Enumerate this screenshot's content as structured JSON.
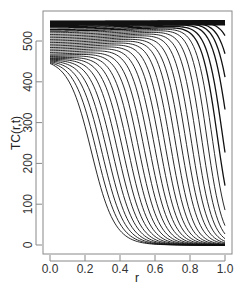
{
  "chart_data": {
    "type": "line",
    "title": "",
    "xlabel": "r",
    "ylabel": "TC(r,t)",
    "xlim": [
      -0.04,
      1.04
    ],
    "ylim": [
      -20,
      560
    ],
    "xticks": [
      0.0,
      0.2,
      0.4,
      0.6,
      0.8,
      1.0
    ],
    "xtick_labels": [
      "0.0",
      "0.2",
      "0.4",
      "0.6",
      "0.8",
      "1.0"
    ],
    "yticks": [
      0,
      100,
      200,
      300,
      400,
      500
    ],
    "ytick_labels": [
      "0",
      "100",
      "200",
      "300",
      "400",
      "500"
    ],
    "grid": false,
    "legend": null,
    "line_color": "#111111",
    "x": [
      0.0,
      0.1,
      0.2,
      0.3,
      0.4,
      0.5,
      0.6,
      0.7,
      0.8,
      0.9,
      1.0
    ],
    "curve_params": [
      {
        "a0": 548,
        "a1": 550,
        "r0": 2.0,
        "w": 0.05
      },
      {
        "a0": 546,
        "a1": 550,
        "r0": 1.6,
        "w": 0.05
      },
      {
        "a0": 544,
        "a1": 550,
        "r0": 1.35,
        "w": 0.05
      },
      {
        "a0": 542,
        "a1": 550,
        "r0": 1.2,
        "w": 0.05
      },
      {
        "a0": 540,
        "a1": 549,
        "r0": 1.12,
        "w": 0.045
      },
      {
        "a0": 538,
        "a1": 548,
        "r0": 1.08,
        "w": 0.045
      },
      {
        "a0": 535,
        "a1": 547,
        "r0": 1.05,
        "w": 0.045
      },
      {
        "a0": 532,
        "a1": 545,
        "r0": 1.02,
        "w": 0.045
      },
      {
        "a0": 528,
        "a1": 543,
        "r0": 0.985,
        "w": 0.045
      },
      {
        "a0": 524,
        "a1": 541,
        "r0": 0.955,
        "w": 0.045
      },
      {
        "a0": 520,
        "a1": 539,
        "r0": 0.925,
        "w": 0.045
      },
      {
        "a0": 516,
        "a1": 537,
        "r0": 0.895,
        "w": 0.045
      },
      {
        "a0": 512,
        "a1": 535,
        "r0": 0.865,
        "w": 0.046
      },
      {
        "a0": 508,
        "a1": 533,
        "r0": 0.835,
        "w": 0.047
      },
      {
        "a0": 504,
        "a1": 531,
        "r0": 0.805,
        "w": 0.048
      },
      {
        "a0": 500,
        "a1": 529,
        "r0": 0.775,
        "w": 0.049
      },
      {
        "a0": 496,
        "a1": 527,
        "r0": 0.745,
        "w": 0.05
      },
      {
        "a0": 492,
        "a1": 525,
        "r0": 0.715,
        "w": 0.05
      },
      {
        "a0": 488,
        "a1": 523,
        "r0": 0.685,
        "w": 0.051
      },
      {
        "a0": 484,
        "a1": 521,
        "r0": 0.655,
        "w": 0.052
      },
      {
        "a0": 480,
        "a1": 519,
        "r0": 0.625,
        "w": 0.053
      },
      {
        "a0": 476,
        "a1": 517,
        "r0": 0.595,
        "w": 0.054
      },
      {
        "a0": 472,
        "a1": 515,
        "r0": 0.565,
        "w": 0.055
      },
      {
        "a0": 468,
        "a1": 513,
        "r0": 0.535,
        "w": 0.056
      },
      {
        "a0": 465,
        "a1": 511,
        "r0": 0.505,
        "w": 0.057
      },
      {
        "a0": 462,
        "a1": 509,
        "r0": 0.475,
        "w": 0.058
      },
      {
        "a0": 459,
        "a1": 507,
        "r0": 0.445,
        "w": 0.059
      },
      {
        "a0": 457,
        "a1": 505,
        "r0": 0.415,
        "w": 0.06
      },
      {
        "a0": 455,
        "a1": 503,
        "r0": 0.385,
        "w": 0.061
      },
      {
        "a0": 453,
        "a1": 501,
        "r0": 0.355,
        "w": 0.062
      },
      {
        "a0": 451,
        "a1": 499,
        "r0": 0.325,
        "w": 0.063
      },
      {
        "a0": 449,
        "a1": 497,
        "r0": 0.295,
        "w": 0.064
      },
      {
        "a0": 447,
        "a1": 495,
        "r0": 0.265,
        "w": 0.065
      },
      {
        "a0": 445,
        "a1": 493,
        "r0": 0.235,
        "w": 0.066
      }
    ],
    "series": [
      {
        "name": "t1",
        "values": [
          548,
          548,
          549,
          549,
          549,
          549,
          550,
          550,
          550,
          550,
          550
        ]
      },
      {
        "name": "t5",
        "values": [
          540,
          541,
          542,
          543,
          544,
          545,
          546,
          547,
          546,
          535,
          459
        ]
      },
      {
        "name": "t9",
        "values": [
          528,
          529,
          531,
          532,
          534,
          535,
          535,
          530,
          500,
          380,
          127
        ]
      },
      {
        "name": "t13",
        "values": [
          512,
          514,
          516,
          518,
          519,
          518,
          510,
          470,
          320,
          100,
          15
        ]
      },
      {
        "name": "t17",
        "values": [
          496,
          499,
          501,
          501,
          497,
          480,
          410,
          240,
          70,
          10,
          1
        ]
      },
      {
        "name": "t21",
        "values": [
          480,
          482,
          483,
          477,
          450,
          360,
          190,
          50,
          7,
          1,
          0
        ]
      },
      {
        "name": "t25",
        "values": [
          465,
          466,
          460,
          430,
          330,
          170,
          45,
          7,
          1,
          0,
          0
        ]
      },
      {
        "name": "t29",
        "values": [
          453,
          450,
          420,
          320,
          160,
          45,
          8,
          1,
          0,
          0,
          0
        ]
      },
      {
        "name": "t34",
        "values": [
          445,
          430,
          330,
          170,
          50,
          10,
          2,
          0,
          0,
          0,
          0
        ]
      }
    ]
  }
}
